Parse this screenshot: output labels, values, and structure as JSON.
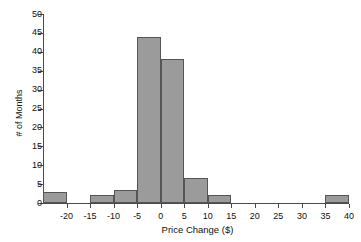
{
  "chart_data": {
    "type": "bar",
    "title": "",
    "xlabel": "Price Change ($)",
    "ylabel": "# of Months",
    "xlim": [
      -25,
      40
    ],
    "ylim": [
      0,
      50
    ],
    "grid": false,
    "legend": null,
    "bin_width": 5,
    "xticks": [
      "-20",
      "-15",
      "-10",
      "-5",
      "0",
      "5",
      "10",
      "15",
      "20",
      "25",
      "30",
      "35",
      "40"
    ],
    "xtick_values": [
      -20,
      -15,
      -10,
      -5,
      0,
      5,
      10,
      15,
      20,
      25,
      30,
      35,
      40
    ],
    "yticks": [
      "0",
      "5",
      "10",
      "15",
      "20",
      "25",
      "30",
      "35",
      "40",
      "45",
      "50"
    ],
    "ytick_values": [
      0,
      5,
      10,
      15,
      20,
      25,
      30,
      35,
      40,
      45,
      50
    ],
    "bin_edges": [
      -25,
      -20,
      -15,
      -10,
      -5,
      0,
      5,
      10,
      15,
      20,
      25,
      30,
      35,
      40
    ],
    "categories": [
      "-25 to -20",
      "-20 to -15",
      "-15 to -10",
      "-10 to -5",
      "-5 to 0",
      "0 to 5",
      "5 to 10",
      "10 to 15",
      "15 to 20",
      "20 to 25",
      "25 to 30",
      "30 to 35",
      "35 to 40"
    ],
    "values": [
      3,
      0,
      2,
      3.5,
      44,
      38,
      6.5,
      2,
      0,
      0,
      0,
      0,
      2
    ],
    "bars": [
      {
        "x0": -25,
        "x1": -20,
        "value": 3
      },
      {
        "x0": -20,
        "x1": -15,
        "value": 0
      },
      {
        "x0": -15,
        "x1": -10,
        "value": 2
      },
      {
        "x0": -10,
        "x1": -5,
        "value": 3.5
      },
      {
        "x0": -5,
        "x1": 0,
        "value": 44
      },
      {
        "x0": 0,
        "x1": 5,
        "value": 38
      },
      {
        "x0": 5,
        "x1": 10,
        "value": 6.5
      },
      {
        "x0": 10,
        "x1": 15,
        "value": 2
      },
      {
        "x0": 15,
        "x1": 20,
        "value": 0
      },
      {
        "x0": 20,
        "x1": 25,
        "value": 0
      },
      {
        "x0": 25,
        "x1": 30,
        "value": 0
      },
      {
        "x0": 30,
        "x1": 35,
        "value": 0
      },
      {
        "x0": 35,
        "x1": 40,
        "value": 2
      }
    ],
    "colors": {
      "bar_fill": "#9b9b9b",
      "bar_border": "#555555",
      "axis": "#4a4a4a",
      "text": "#111111",
      "background": "#ffffff"
    }
  }
}
